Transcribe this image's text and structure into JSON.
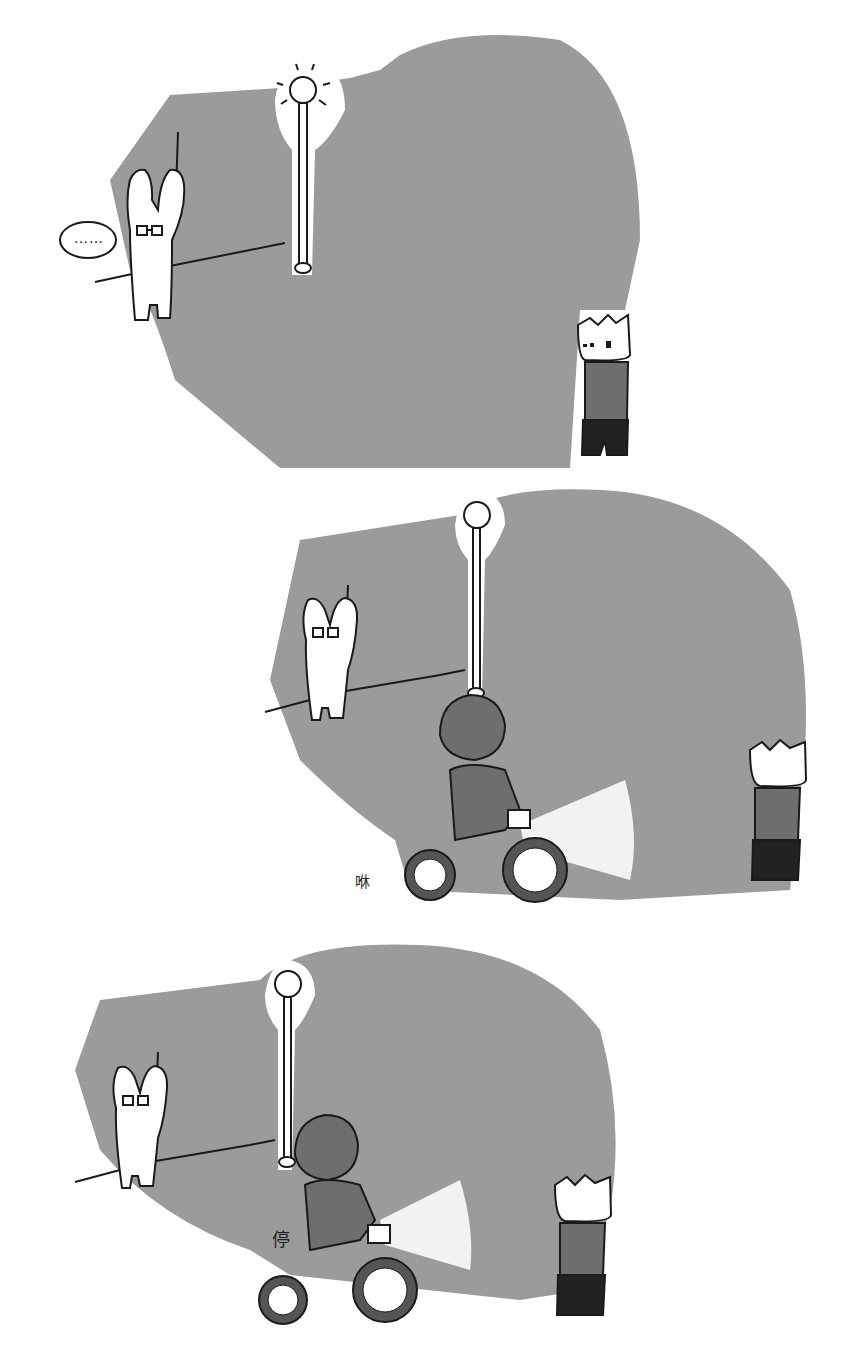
{
  "comic": {
    "panel_count": 3,
    "colors": {
      "background": "#ffffff",
      "night_fill": "#9b9b9b",
      "ink": "#1a1a1a",
      "sweater": "#6e6e6e",
      "pants": "#222222"
    },
    "panels": [
      {
        "index": 1,
        "speech_bubble": "……",
        "characters": [
          "rabbit-with-glasses",
          "spiky-hair-boy"
        ],
        "props": [
          "street-lamp"
        ]
      },
      {
        "index": 2,
        "sound_effect": "咻",
        "characters": [
          "rabbit-with-glasses",
          "spiky-hair-boy",
          "girl-on-bicycle"
        ],
        "props": [
          "street-lamp",
          "bicycle-headlight"
        ]
      },
      {
        "index": 3,
        "sound_effect": "停",
        "characters": [
          "rabbit-with-glasses",
          "spiky-hair-boy",
          "girl-on-bicycle"
        ],
        "props": [
          "street-lamp",
          "bicycle-headlight"
        ]
      }
    ]
  }
}
